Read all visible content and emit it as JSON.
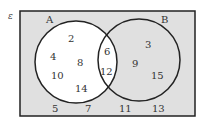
{
  "diagram": {
    "type": "venn",
    "universe_label": "ε",
    "colors": {
      "background": "#e0e0e0",
      "set_a_fill": "#ffffff",
      "outline": "#222222"
    },
    "sets": [
      {
        "name": "A",
        "only": [
          "2",
          "4",
          "8",
          "10",
          "14"
        ]
      },
      {
        "name": "B",
        "only": [
          "3",
          "9",
          "15"
        ]
      }
    ],
    "intersection": [
      "6",
      "12"
    ],
    "outside": [
      "5",
      "7",
      "11",
      "13"
    ]
  }
}
